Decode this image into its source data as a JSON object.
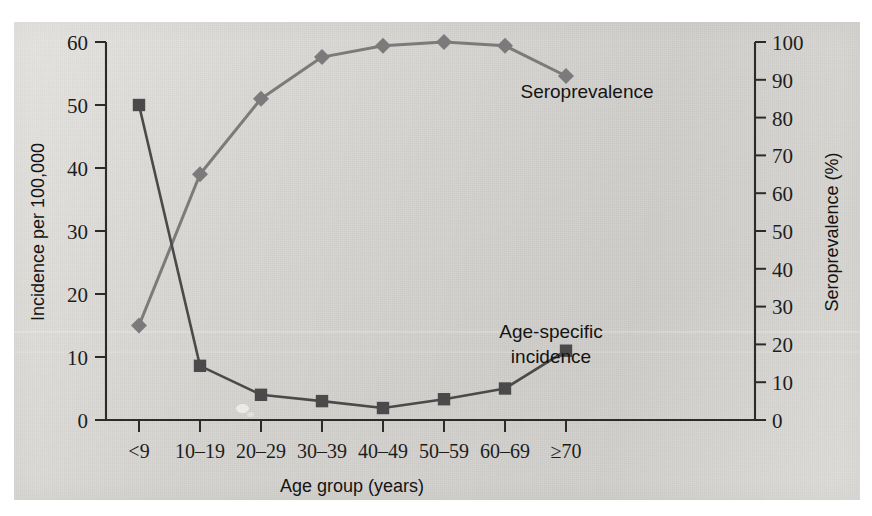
{
  "figure": {
    "background_color": "#d8d6d2",
    "page_color": "#ffffff"
  },
  "chart_data": {
    "type": "line",
    "title": "",
    "xlabel": "Age group (years)",
    "ylabel": "Incidence per 100,000",
    "y2label": "Seroprevalence (%)",
    "categories": [
      "<9",
      "10–19",
      "20–29",
      "30–39",
      "40–49",
      "50–59",
      "60–69",
      "≥70"
    ],
    "ylim": [
      0,
      60
    ],
    "yticks": [
      0,
      10,
      20,
      30,
      40,
      50,
      60
    ],
    "y2lim": [
      0,
      100
    ],
    "y2ticks": [
      0,
      10,
      20,
      30,
      40,
      50,
      60,
      70,
      80,
      90,
      100
    ],
    "grid": false,
    "legend_position": "inline-annotations",
    "series": [
      {
        "name": "Seroprevalence",
        "axis": "right",
        "unit": "%",
        "marker": "diamond",
        "color": "#7b7b7b",
        "values": [
          25,
          65,
          85,
          96,
          99,
          100,
          99,
          91
        ]
      },
      {
        "name": "Age-specific incidence",
        "axis": "left",
        "unit": "per 100,000",
        "marker": "square",
        "color": "#4a4a4a",
        "values": [
          50.0,
          8.6,
          4.0,
          3.0,
          1.9,
          3.3,
          5.0,
          11.0
        ]
      }
    ],
    "annotations": [
      {
        "text": "Seroprevalence",
        "series": "Seroprevalence"
      },
      {
        "text": "Age-specific",
        "series": "Age-specific incidence"
      },
      {
        "text": "incidence",
        "series": "Age-specific incidence"
      }
    ]
  },
  "axes": {
    "left": {
      "title": "Incidence per 100,000",
      "labels": [
        "0",
        "10",
        "20",
        "30",
        "40",
        "50",
        "60"
      ]
    },
    "right": {
      "title": "Seroprevalence (%)",
      "labels": [
        "0",
        "10",
        "20",
        "30",
        "40",
        "50",
        "60",
        "70",
        "80",
        "90",
        "100"
      ]
    },
    "bottom": {
      "title": "Age group (years)",
      "labels": [
        "<9",
        "10–19",
        "20–29",
        "30–39",
        "40–49",
        "50–59",
        "60–69",
        "≥70"
      ]
    }
  },
  "labels": {
    "seroprevalence": "Seroprevalence",
    "incidence_line1": "Age-specific",
    "incidence_line2": "incidence"
  }
}
